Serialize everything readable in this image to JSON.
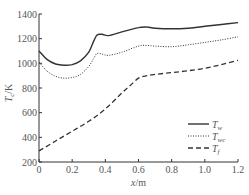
{
  "chart_data": {
    "type": "line",
    "title": "",
    "xlabel": "x/m",
    "ylabel": "T_c/K",
    "xlim": [
      0,
      1.2
    ],
    "ylim": [
      200,
      1400
    ],
    "xticks": [
      0,
      0.2,
      0.4,
      0.6,
      0.8,
      1.0,
      1.2
    ],
    "xtick_labels": [
      "0",
      "0.2",
      "0.4",
      "0.6",
      "0.8",
      "1.0",
      "1.2"
    ],
    "yticks": [
      200,
      400,
      600,
      800,
      1000,
      1200,
      1400
    ],
    "ytick_labels": [
      "200",
      "400",
      "600",
      "800",
      "1000",
      "1200",
      "1400"
    ],
    "grid": false,
    "legend_position": "lower right",
    "series": [
      {
        "name": "T_w",
        "label_main": "T",
        "label_sub": "w",
        "style": "solid",
        "x": [
          0,
          0.05,
          0.1,
          0.15,
          0.2,
          0.25,
          0.3,
          0.33,
          0.35,
          0.38,
          0.42,
          0.5,
          0.6,
          0.65,
          0.7,
          0.8,
          0.9,
          1.0,
          1.1,
          1.2
        ],
        "values": [
          1100,
          1030,
          995,
          985,
          990,
          1020,
          1090,
          1180,
          1230,
          1235,
          1225,
          1255,
          1290,
          1295,
          1285,
          1280,
          1285,
          1300,
          1315,
          1330
        ]
      },
      {
        "name": "T_wc",
        "label_main": "T",
        "label_sub": "wc",
        "style": "dotted",
        "x": [
          0,
          0.05,
          0.1,
          0.15,
          0.2,
          0.25,
          0.3,
          0.33,
          0.35,
          0.38,
          0.42,
          0.5,
          0.6,
          0.65,
          0.7,
          0.8,
          0.9,
          1.0,
          1.1,
          1.2
        ],
        "values": [
          1010,
          935,
          895,
          880,
          885,
          910,
          975,
          1040,
          1080,
          1075,
          1065,
          1090,
          1140,
          1145,
          1140,
          1135,
          1150,
          1170,
          1190,
          1215
        ]
      },
      {
        "name": "T_f",
        "label_main": "T",
        "label_sub": "f",
        "style": "dashed",
        "x": [
          0,
          0.1,
          0.2,
          0.3,
          0.4,
          0.5,
          0.55,
          0.6,
          0.65,
          0.7,
          0.8,
          0.9,
          1.0,
          1.1,
          1.2
        ],
        "values": [
          290,
          370,
          450,
          530,
          630,
          760,
          820,
          880,
          900,
          910,
          925,
          940,
          960,
          990,
          1025
        ]
      }
    ]
  }
}
